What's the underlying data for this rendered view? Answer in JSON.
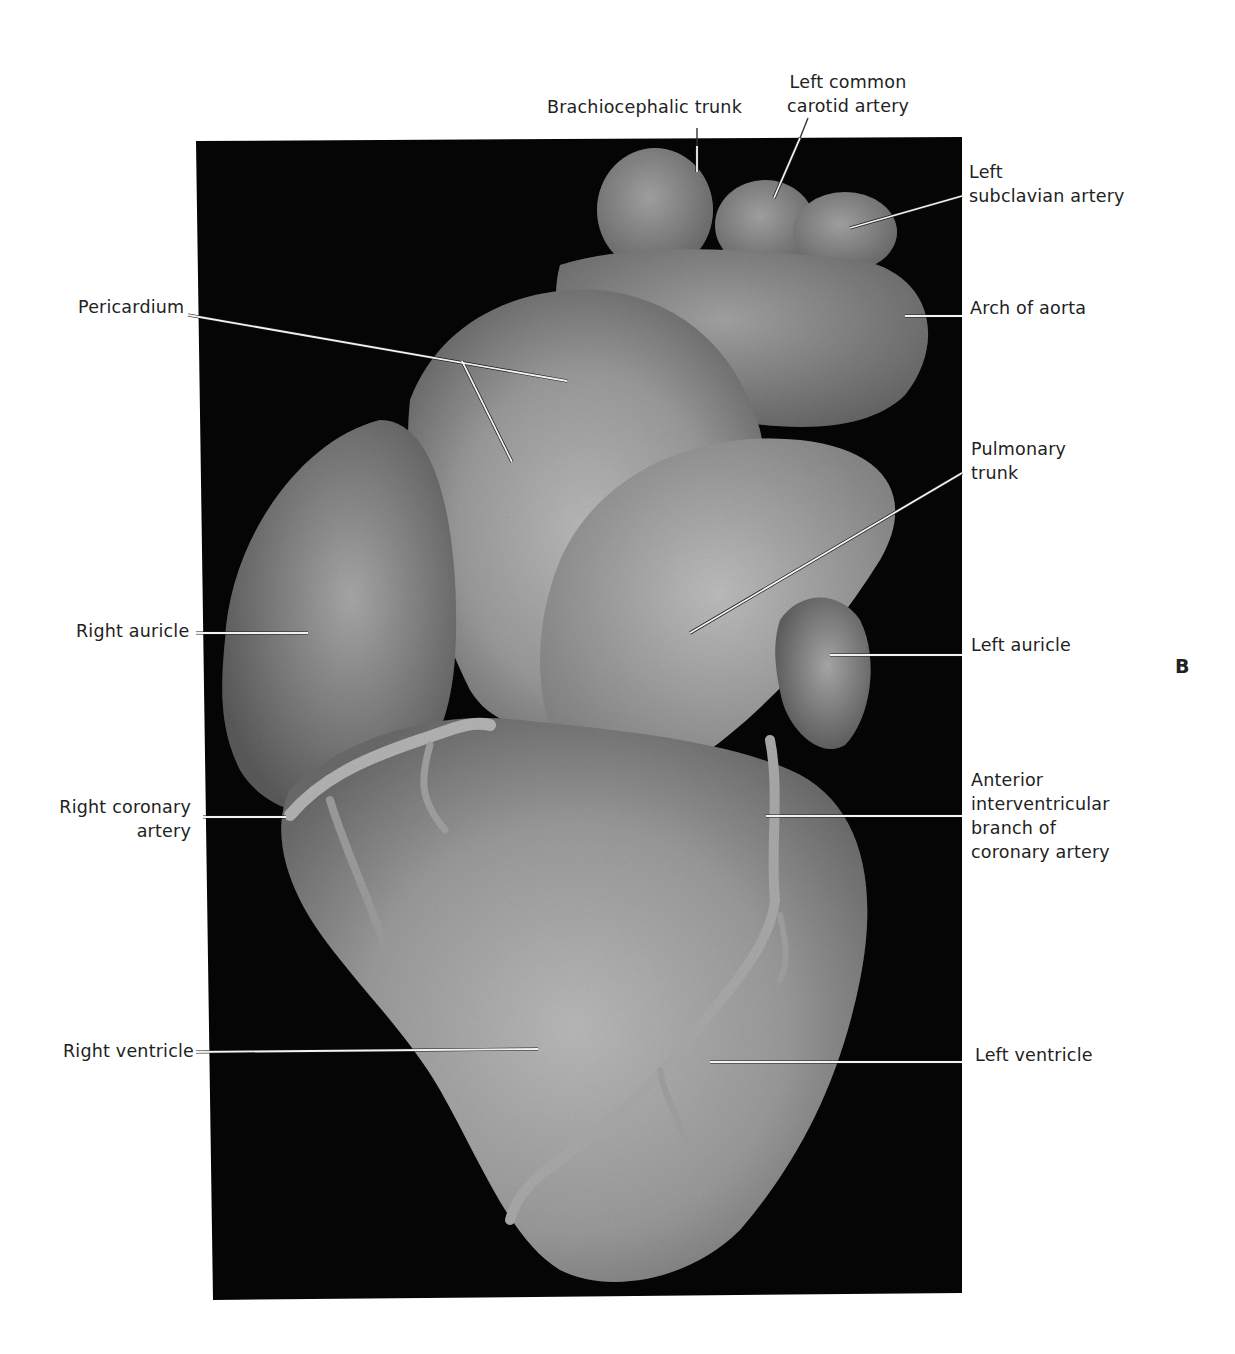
{
  "figure": {
    "panel_letter": "B",
    "photo_frame": {
      "top_left": [
        196,
        141
      ],
      "top_right": [
        962,
        137
      ],
      "bottom_right": [
        962,
        1293
      ],
      "bottom_left": [
        213,
        1300
      ]
    },
    "colors": {
      "background": "#ffffff",
      "photo_bg": "#050505",
      "tissue_light": "#b8b8b8",
      "tissue_mid": "#8f8f8f",
      "tissue_dark": "#5e5e5e",
      "leader_line": "#f2f2f2",
      "text": "#222222"
    }
  },
  "labels": {
    "brachiocephalic_trunk": "Brachiocephalic trunk",
    "left_common_carotid_1": "Left common",
    "left_common_carotid_2": "carotid artery",
    "left_subclavian_1": "Left",
    "left_subclavian_2": "subclavian artery",
    "pericardium": "Pericardium",
    "arch_of_aorta": "Arch of aorta",
    "pulmonary_trunk_1": "Pulmonary",
    "pulmonary_trunk_2": "trunk",
    "right_auricle": "Right auricle",
    "left_auricle": "Left auricle",
    "right_coronary_1": "Right coronary",
    "right_coronary_2": "artery",
    "anterior_iv_1": "Anterior",
    "anterior_iv_2": "interventricular",
    "anterior_iv_3": "branch of",
    "anterior_iv_4": "coronary artery",
    "right_ventricle": "Right ventricle",
    "left_ventricle": "Left ventricle"
  }
}
